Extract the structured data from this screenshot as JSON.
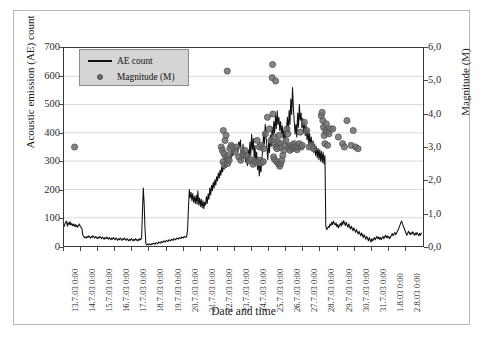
{
  "chart_data": {
    "type": "line",
    "title": "",
    "xlabel": "Date and time",
    "ylabel": "Acoustic emission (AE) count",
    "y2label": "Magnitude (M)",
    "grid": "horizontal",
    "legend_position": "top-left-inside",
    "ylim": [
      0,
      700
    ],
    "yticks": [
      0,
      100,
      200,
      300,
      400,
      500,
      600,
      700
    ],
    "ytick_labels": [
      "0",
      "100",
      "200",
      "300",
      "400",
      "500",
      "600",
      "700"
    ],
    "y2lim": [
      0.0,
      6.0
    ],
    "y2ticks": [
      0.0,
      1.0,
      2.0,
      3.0,
      4.0,
      5.0,
      6.0
    ],
    "y2tick_labels": [
      "0,0",
      "1,0",
      "2,0",
      "3,0",
      "4,0",
      "5,0",
      "6,0"
    ],
    "xlim_days": [
      13.0,
      34.0
    ],
    "xtick_labels": [
      "13.7.03 0:00",
      "14.7.03 0:00",
      "15.7.03 0:00",
      "16.7.03 0:00",
      "17.7.03 0:00",
      "18.7.03 0:00",
      "19.7.03 0:00",
      "20.7.03 0:00",
      "21.7.03 0:00",
      "22.7.03 0:00",
      "23.7.03 0:00",
      "24.7.03 0:00",
      "25.7.03 0:00",
      "26.7.03 0:00",
      "27.7.03 0:00",
      "28.7.03 0:00",
      "29.7.03 0:00",
      "30.7.03 0:00",
      "31.7.03 0:00",
      "1.8.03 0:00",
      "2.8.03 0:00"
    ],
    "series": [
      {
        "name": "AE count",
        "type": "line",
        "axis": "left",
        "color": "#101010",
        "values": [
          68,
          78,
          84,
          88,
          70,
          82,
          76,
          86,
          74,
          80,
          72,
          78,
          70,
          76,
          68,
          74,
          66,
          72,
          78,
          70,
          66,
          62,
          40,
          34,
          30,
          32,
          28,
          34,
          30,
          36,
          32,
          28,
          34,
          30,
          36,
          32,
          28,
          34,
          30,
          26,
          32,
          28,
          34,
          30,
          26,
          32,
          28,
          24,
          30,
          26,
          32,
          28,
          24,
          30,
          26,
          22,
          28,
          24,
          30,
          26,
          22,
          28,
          24,
          20,
          26,
          22,
          28,
          24,
          20,
          26,
          22,
          28,
          24,
          20,
          26,
          22,
          18,
          24,
          20,
          26,
          22,
          18,
          24,
          20,
          26,
          22,
          18,
          24,
          20,
          26,
          22,
          28,
          120,
          205,
          150,
          60,
          10,
          4,
          6,
          4,
          8,
          6,
          4,
          8,
          6,
          10,
          8,
          6,
          12,
          10,
          8,
          14,
          12,
          10,
          16,
          14,
          12,
          18,
          16,
          14,
          20,
          18,
          16,
          22,
          20,
          18,
          24,
          22,
          20,
          26,
          24,
          22,
          28,
          26,
          24,
          30,
          28,
          26,
          32,
          30,
          28,
          34,
          32,
          30,
          36,
          60,
          140,
          200,
          170,
          190,
          160,
          185,
          155,
          175,
          150,
          180,
          148,
          195,
          145,
          170,
          140,
          165,
          135,
          160,
          132,
          155,
          145,
          175,
          150,
          185,
          165,
          205,
          180,
          215,
          195,
          225,
          205,
          235,
          215,
          245,
          230,
          258,
          240,
          268,
          250,
          278,
          262,
          288,
          272,
          295,
          280,
          305,
          290,
          312,
          298,
          320,
          310,
          335,
          318,
          345,
          330,
          355,
          340,
          348,
          332,
          368,
          352,
          375,
          300,
          330,
          360,
          310,
          342,
          296,
          318,
          284,
          340,
          300,
          368,
          320,
          395,
          340,
          380,
          310,
          355,
          290,
          332,
          270,
          310,
          248,
          285,
          262,
          305,
          340,
          400,
          360,
          430,
          385,
          345,
          305,
          368,
          330,
          392,
          352,
          420,
          378,
          440,
          400,
          465,
          415,
          478,
          430,
          455,
          408,
          440,
          395,
          425,
          380,
          410,
          365,
          395,
          420,
          455,
          400,
          480,
          430,
          520,
          465,
          560,
          490,
          440,
          395,
          430,
          385,
          470,
          420,
          500,
          445,
          470,
          418,
          452,
          400,
          438,
          390,
          425,
          375,
          410,
          362,
          398,
          350,
          385,
          340,
          372,
          330,
          360,
          320,
          352,
          312,
          345,
          305,
          340,
          300,
          335,
          295,
          330,
          290,
          320,
          70,
          58,
          62,
          70,
          66,
          78,
          72,
          84,
          76,
          88,
          80,
          74,
          82,
          68,
          76,
          64,
          72,
          80,
          70,
          86,
          76,
          90,
          80,
          72,
          84,
          74,
          66,
          78,
          68,
          60,
          70,
          62,
          54,
          64,
          56,
          48,
          58,
          50,
          42,
          52,
          44,
          36,
          46,
          38,
          30,
          40,
          32,
          24,
          34,
          26,
          18,
          30,
          22,
          14,
          26,
          18,
          24,
          30,
          22,
          28,
          34,
          26,
          32,
          24,
          30,
          22,
          28,
          34,
          26,
          32,
          38,
          30,
          36,
          28,
          34,
          26,
          32,
          38,
          44,
          36,
          42,
          48,
          40,
          46,
          52,
          58,
          66,
          74,
          82,
          88,
          78,
          70,
          62,
          54,
          46,
          38,
          44,
          52,
          46,
          40,
          48,
          42,
          50,
          44,
          38,
          46,
          40,
          48,
          42,
          36,
          44,
          38,
          46
        ]
      },
      {
        "name": "Magnitude (M)",
        "type": "scatter",
        "axis": "right",
        "color": "#6e6e6e",
        "points": [
          [
            13.62,
            3.0
          ],
          [
            22.55,
            5.3
          ],
          [
            22.32,
            3.5
          ],
          [
            22.42,
            3.2
          ],
          [
            22.48,
            3.35
          ],
          [
            22.2,
            3.0
          ],
          [
            22.26,
            2.9
          ],
          [
            22.35,
            2.8
          ],
          [
            22.46,
            2.7
          ],
          [
            22.54,
            2.62
          ],
          [
            22.62,
            2.75
          ],
          [
            22.7,
            2.95
          ],
          [
            22.78,
            3.05
          ],
          [
            22.3,
            2.55
          ],
          [
            22.38,
            2.45
          ],
          [
            22.58,
            2.5
          ],
          [
            22.66,
            2.6
          ],
          [
            22.86,
            3.0
          ],
          [
            23.1,
            3.0
          ],
          [
            23.0,
            2.85
          ],
          [
            23.22,
            2.7
          ],
          [
            23.34,
            2.6
          ],
          [
            23.46,
            2.78
          ],
          [
            23.58,
            2.9
          ],
          [
            23.7,
            2.72
          ],
          [
            23.82,
            2.58
          ],
          [
            23.94,
            2.62
          ],
          [
            24.06,
            2.48
          ],
          [
            24.18,
            2.56
          ],
          [
            24.3,
            2.52
          ],
          [
            24.42,
            2.6
          ],
          [
            24.54,
            2.52
          ],
          [
            24.66,
            2.56
          ],
          [
            24.3,
            3.2
          ],
          [
            24.42,
            3.0
          ],
          [
            24.54,
            3.05
          ],
          [
            24.66,
            2.95
          ],
          [
            24.78,
            3.4
          ],
          [
            24.9,
            3.9
          ],
          [
            25.02,
            3.55
          ],
          [
            25.1,
            3.2
          ],
          [
            25.18,
            5.1
          ],
          [
            25.2,
            5.5
          ],
          [
            25.38,
            5.0
          ],
          [
            25.22,
            4.0
          ],
          [
            25.3,
            3.3
          ],
          [
            25.34,
            3.1
          ],
          [
            25.4,
            3.0
          ],
          [
            25.46,
            2.95
          ],
          [
            25.52,
            3.15
          ],
          [
            25.58,
            3.35
          ],
          [
            25.64,
            3.1
          ],
          [
            25.7,
            2.98
          ],
          [
            25.26,
            2.7
          ],
          [
            25.32,
            2.62
          ],
          [
            25.44,
            2.55
          ],
          [
            25.56,
            2.48
          ],
          [
            25.62,
            2.42
          ],
          [
            25.68,
            2.5
          ],
          [
            25.74,
            2.6
          ],
          [
            25.8,
            2.75
          ],
          [
            25.86,
            2.9
          ],
          [
            25.92,
            3.05
          ],
          [
            25.98,
            3.2
          ],
          [
            26.04,
            3.55
          ],
          [
            26.1,
            3.4
          ],
          [
            26.16,
            3.0
          ],
          [
            26.22,
            2.9
          ],
          [
            26.28,
            3.05
          ],
          [
            26.34,
            2.95
          ],
          [
            26.4,
            3.0
          ],
          [
            26.46,
            3.1
          ],
          [
            26.52,
            2.98
          ],
          [
            26.58,
            3.02
          ],
          [
            26.64,
            2.92
          ],
          [
            26.7,
            3.0
          ],
          [
            26.76,
            3.1
          ],
          [
            26.82,
            3.45
          ],
          [
            26.88,
            3.0
          ],
          [
            26.94,
            3.05
          ],
          [
            27.06,
            3.75
          ],
          [
            27.2,
            3.5
          ],
          [
            27.34,
            3.0
          ],
          [
            27.48,
            3.05
          ],
          [
            27.6,
            2.95
          ],
          [
            28.05,
            3.95
          ],
          [
            28.1,
            4.05
          ],
          [
            28.14,
            3.8
          ],
          [
            28.18,
            3.6
          ],
          [
            28.22,
            3.35
          ],
          [
            28.26,
            3.1
          ],
          [
            28.3,
            3.5
          ],
          [
            28.34,
            3.7
          ],
          [
            28.38,
            3.45
          ],
          [
            28.42,
            3.05
          ],
          [
            28.5,
            3.4
          ],
          [
            28.58,
            3.55
          ],
          [
            28.72,
            3.55
          ],
          [
            29.05,
            3.3
          ],
          [
            29.3,
            3.1
          ],
          [
            29.4,
            3.0
          ],
          [
            29.55,
            3.8
          ],
          [
            29.8,
            3.05
          ],
          [
            29.92,
            3.5
          ],
          [
            30.05,
            3.0
          ],
          [
            30.2,
            2.95
          ]
        ]
      }
    ]
  }
}
